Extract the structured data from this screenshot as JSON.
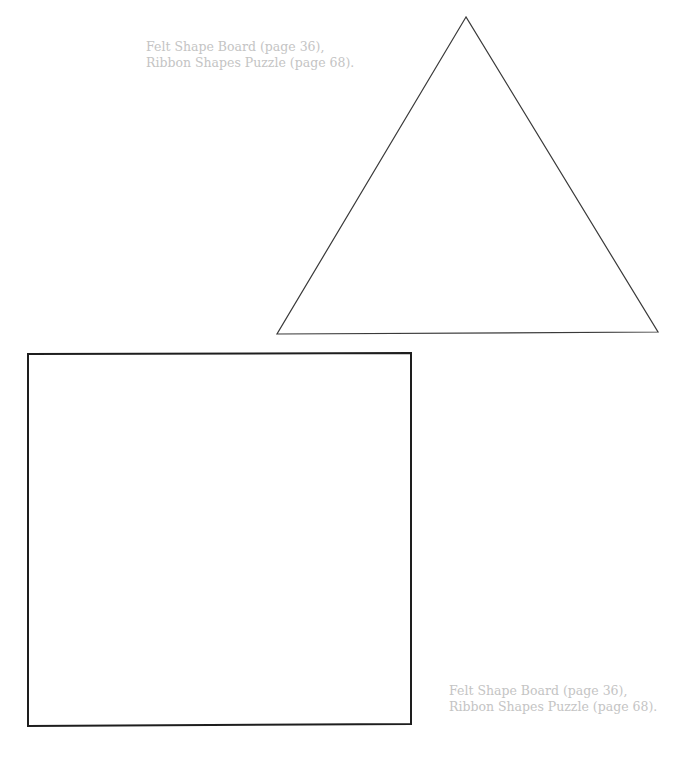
{
  "page": {
    "background": "#ffffff"
  },
  "captions": {
    "top": {
      "line1": "Felt Shape Board (page 36),",
      "line2": "Ribbon Shapes Puzzle (page 68)."
    },
    "bottom": {
      "line1": "Felt Shape Board (page 36),",
      "line2": "Ribbon Shapes Puzzle (page 68)."
    },
    "color": "#c4c4c4"
  },
  "shapes": {
    "triangle": {
      "name": "triangle-template",
      "stroke": "#3a3a3a",
      "points": "466,17 277,334 658,332"
    },
    "square": {
      "name": "square-template",
      "stroke": "#1e1e1e",
      "points": "28,354 411,353 411,724 28,726"
    }
  }
}
